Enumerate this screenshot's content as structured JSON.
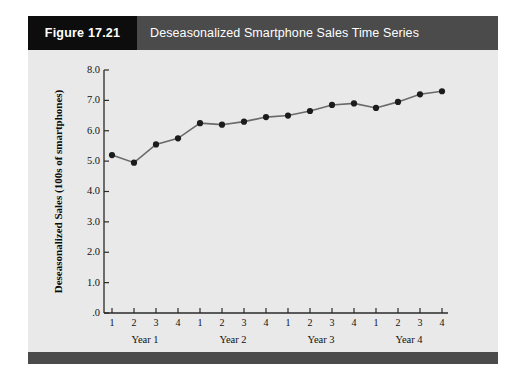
{
  "header": {
    "figure_number": "Figure 17.21",
    "title": "Deseasonalized Smartphone Sales Time Series"
  },
  "chart_data": {
    "type": "line",
    "title": "Deseasonalized Smartphone Sales Time Series",
    "xlabel": "",
    "ylabel": "Deseasonalized Sales (100s of smartphones)",
    "ylim": [
      0,
      8
    ],
    "ytick_labels": [
      ".0",
      "1.0",
      "2.0",
      "3.0",
      "4.0",
      "5.0",
      "6.0",
      "7.0",
      "8.0"
    ],
    "ytick_values": [
      0,
      1,
      2,
      3,
      4,
      5,
      6,
      7,
      8
    ],
    "xtick_labels": [
      "1",
      "2",
      "3",
      "4",
      "1",
      "2",
      "3",
      "4",
      "1",
      "2",
      "3",
      "4",
      "1",
      "2",
      "3",
      "4"
    ],
    "group_labels": [
      "Year 1",
      "Year 2",
      "Year 3",
      "Year 4"
    ],
    "categories": [
      "Year 1 Q1",
      "Year 1 Q2",
      "Year 1 Q3",
      "Year 1 Q4",
      "Year 2 Q1",
      "Year 2 Q2",
      "Year 2 Q3",
      "Year 2 Q4",
      "Year 3 Q1",
      "Year 3 Q2",
      "Year 3 Q3",
      "Year 3 Q4",
      "Year 4 Q1",
      "Year 4 Q2",
      "Year 4 Q3",
      "Year 4 Q4"
    ],
    "values": [
      5.2,
      4.95,
      5.55,
      5.75,
      6.25,
      6.2,
      6.3,
      6.45,
      6.5,
      6.65,
      6.85,
      6.9,
      6.75,
      6.95,
      7.2,
      7.3
    ],
    "grid": false,
    "legend": false,
    "marker": "circle",
    "line_color": "#6a6a6a",
    "marker_color": "#1c1c1c",
    "panel_color": "#e9e9e9",
    "header_bar_color": "#4b4b4b",
    "figure_tag_color": "#0d0d0d"
  }
}
